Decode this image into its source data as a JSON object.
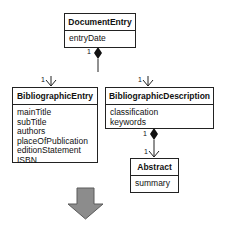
{
  "classes": {
    "documentEntry": {
      "name": "DocumentEntry",
      "attributes": [
        "entryDate"
      ]
    },
    "bibliographicEntry": {
      "name": "BibliographicEntry",
      "attributes": [
        "mainTitle",
        "subTitle",
        "authors",
        "placeOfPublication",
        "editionStatement",
        "ISBN"
      ]
    },
    "bibliographicDescription": {
      "name": "BibliographicDescription",
      "attributes": [
        "classification",
        "keywords"
      ]
    },
    "abstract": {
      "name": "Abstract",
      "attributes": [
        "summary"
      ]
    }
  },
  "relations": [
    {
      "from": "DocumentEntry",
      "to": "BibliographicEntry",
      "type": "composition",
      "source_multiplicity": "1",
      "target_multiplicity": "1"
    },
    {
      "from": "DocumentEntry",
      "to": "BibliographicDescription",
      "type": "composition",
      "source_multiplicity": "1",
      "target_multiplicity": "1"
    },
    {
      "from": "BibliographicDescription",
      "to": "Abstract",
      "type": "composition",
      "source_multiplicity": "1",
      "target_multiplicity": "1"
    }
  ],
  "multiplicities": {
    "docEntry_source": "1",
    "bibEntry_target": "1",
    "bibDesc_target": "1",
    "bibDesc_source": "1",
    "abstract_target": "1"
  },
  "colors": {
    "arrow_fill": "#8c8c8c",
    "arrow_stroke": "#5a5a5a",
    "line": "#222222"
  }
}
